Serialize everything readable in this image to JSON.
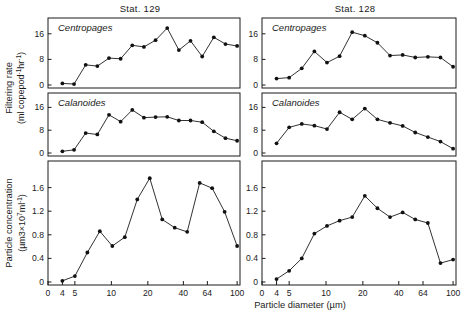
{
  "figure": {
    "width": 468,
    "height": 318,
    "background": "#ffffff",
    "ink_color": "#1b1b1b"
  },
  "axis_titles": {
    "y_top": "Filtering rate",
    "y_top_units_pre": "(ml copepod",
    "y_top_units_sup1": "-1",
    "y_top_units_mid": "hr",
    "y_top_units_sup2": "-1",
    "y_top_units_post": ")",
    "y_bottom": "Particle concentration",
    "y_bottom_units_pre": "(µm3×10",
    "y_bottom_units_sup1": "7",
    "y_bottom_units_mid": "ml",
    "y_bottom_units_sup2": "-1",
    "y_bottom_units_post": ")",
    "x_axis": "Particle diameter (µm)"
  },
  "columns": [
    {
      "id": "left",
      "title": "Stat. 129"
    },
    {
      "id": "right",
      "title": "Stat. 128"
    }
  ],
  "x_ticks": [
    0,
    4,
    5,
    10,
    20,
    40,
    64,
    100
  ],
  "x_tick_labels": [
    "0",
    "4",
    "5",
    "10",
    "20",
    "40",
    "64",
    "100"
  ],
  "y_ticks_filtering": [
    0,
    8,
    16
  ],
  "y_tick_labels_filtering": [
    "0",
    "8",
    "16"
  ],
  "y_ticks_particle": [
    0,
    0.4,
    0.8,
    1.2,
    1.6
  ],
  "y_tick_labels_particle": [
    "0",
    "0.4",
    "0.8",
    "1.2",
    "1.6"
  ],
  "chart_data": [
    {
      "type": "line",
      "title": "Stat. 129",
      "panel": "Centropages - Stat. 129",
      "series_label": "Centropages",
      "xlabel": "Particle diameter (µm)",
      "ylabel": "Filtering rate (ml copepod-1 hr-1)",
      "xscale": "log",
      "xlim": [
        3.4,
        108
      ],
      "ylim": [
        0,
        20
      ],
      "x": [
        4.0,
        4.6,
        5.3,
        6.2,
        7.2,
        8.4,
        9.8,
        11.4,
        13.3,
        15.5,
        18.1,
        21.1,
        24.6,
        28.7,
        33.5,
        39.0,
        45.5,
        53.0,
        61.8,
        72.1,
        84.0,
        98.0
      ],
      "y": [
        0.5,
        0.3,
        6.3,
        5.9,
        8.4,
        8.2,
        12.4,
        11.9,
        14.0,
        17.8,
        10.9,
        13.8,
        8.9,
        14.9,
        12.8,
        12.2
      ],
      "values": [
        0.5,
        0.3,
        6.3,
        5.9,
        8.4,
        8.2,
        12.4,
        11.9,
        14.0,
        17.8,
        10.9,
        13.8,
        8.9,
        14.9,
        12.8,
        12.2
      ],
      "grid": false,
      "legend": "none"
    },
    {
      "type": "line",
      "title": "Stat. 129",
      "panel": "Calanoides - Stat. 129",
      "series_label": "Calanoides",
      "xlabel": "Particle diameter (µm)",
      "ylabel": "Filtering rate (ml copepod-1 hr-1)",
      "xscale": "log",
      "xlim": [
        3.4,
        108
      ],
      "ylim": [
        0,
        20
      ],
      "values": [
        0.6,
        1.1,
        7.0,
        6.5,
        13.4,
        11.0,
        15.1,
        12.4,
        12.6,
        12.7,
        11.4,
        11.4,
        10.8,
        7.6,
        5.2,
        4.3
      ],
      "grid": false,
      "legend": "none"
    },
    {
      "type": "line",
      "title": "Stat. 129",
      "panel": "Particle concentration - Stat. 129",
      "series_label": "",
      "xlabel": "Particle diameter (µm)",
      "ylabel": "Particle concentration (µm3×107 ml-1)",
      "xscale": "log",
      "xlim": [
        3.4,
        108
      ],
      "ylim": [
        0,
        2.0
      ],
      "values": [
        0.02,
        0.1,
        0.5,
        0.86,
        0.61,
        0.76,
        1.4,
        1.76,
        1.06,
        0.92,
        0.85,
        1.68,
        1.59,
        1.19,
        0.61
      ],
      "grid": false,
      "legend": "none"
    },
    {
      "type": "line",
      "title": "Stat. 128",
      "panel": "Centropages - Stat. 128",
      "series_label": "Centropages",
      "xlabel": "Particle diameter (µm)",
      "ylabel": "Filtering rate (ml copepod-1 hr-1)",
      "xscale": "log",
      "xlim": [
        3.4,
        108
      ],
      "ylim": [
        0,
        20
      ],
      "values": [
        2.0,
        2.3,
        5.2,
        10.5,
        7.0,
        9.0,
        16.5,
        15.4,
        13.2,
        9.2,
        9.4,
        8.6,
        8.8,
        8.6,
        5.7
      ],
      "grid": false,
      "legend": "none"
    },
    {
      "type": "line",
      "title": "Stat. 128",
      "panel": "Calanoides - Stat. 128",
      "series_label": "Calanoides",
      "xlabel": "Particle diameter (µm)",
      "ylabel": "Filtering rate (ml copepod-1 hr-1)",
      "xscale": "log",
      "xlim": [
        3.4,
        108
      ],
      "ylim": [
        0,
        20
      ],
      "values": [
        3.4,
        9.0,
        10.2,
        9.6,
        8.4,
        14.3,
        11.8,
        15.6,
        11.8,
        10.6,
        9.5,
        7.2,
        5.6,
        4.0,
        1.5
      ],
      "grid": false,
      "legend": "none"
    },
    {
      "type": "line",
      "title": "Stat. 128",
      "panel": "Particle concentration - Stat. 128",
      "series_label": "",
      "xlabel": "Particle diameter (µm)",
      "ylabel": "Particle concentration (µm3×107 ml-1)",
      "xscale": "log",
      "xlim": [
        3.4,
        108
      ],
      "ylim": [
        0,
        2.0
      ],
      "values": [
        0.05,
        0.19,
        0.4,
        0.82,
        0.95,
        1.04,
        1.1,
        1.46,
        1.25,
        1.1,
        1.18,
        1.06,
        1.0,
        0.32,
        0.38
      ],
      "grid": false,
      "legend": "none"
    }
  ]
}
